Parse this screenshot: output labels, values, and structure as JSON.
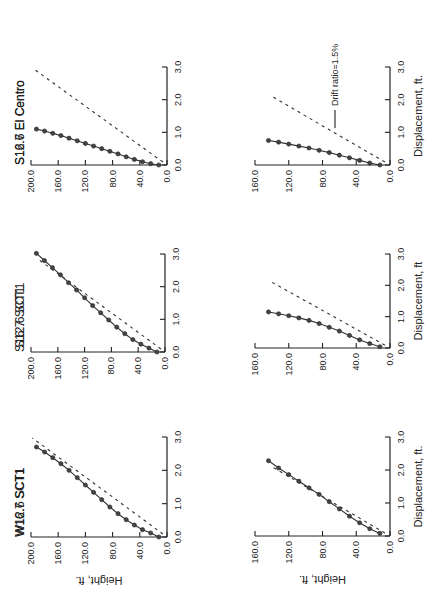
{
  "figure": {
    "orientation": "rotated 90 degrees counterclockwise",
    "legend": {
      "label": "Drift ratio=1.5%",
      "line_style": "dashed"
    },
    "x_axis_label": "Height, ft.",
    "y_axis_label_row1": "Displacement, ft.",
    "y_axis_label_row2_mid": "Displacement, ft"
  },
  "chart_data": [
    {
      "type": "line",
      "title": "W16.7  SCT1",
      "xlabel": "Height, ft.",
      "ylabel": "Displacement, ft.",
      "height_ticks": [
        "0.0",
        "40.0",
        "80.0",
        "120.0",
        "160.0",
        "200.0"
      ],
      "disp_ticks": [
        "0.0",
        "1.0",
        "2.0",
        "3.0"
      ],
      "height_range": [
        0,
        200
      ],
      "disp_range": [
        0,
        3.0
      ],
      "series": [
        {
          "name": "response",
          "height": [
            12,
            24,
            36,
            48,
            60,
            72,
            84,
            96,
            108,
            120,
            132,
            144,
            156,
            168,
            180,
            192
          ],
          "disp": [
            0.0,
            0.12,
            0.22,
            0.36,
            0.52,
            0.7,
            0.9,
            1.12,
            1.34,
            1.56,
            1.78,
            2.0,
            2.2,
            2.38,
            2.55,
            2.7
          ]
        },
        {
          "name": "Drift ratio=1.5%",
          "height": [
            6,
            198
          ],
          "disp": [
            0.09,
            2.97
          ]
        }
      ],
      "panel": {
        "x0": 167,
        "y0": 537,
        "hmax_px": 31,
        "hmax": 200,
        "d3_px": 437
      }
    },
    {
      "type": "line",
      "title": "S16.7  SCT1",
      "xlabel": "Height, ft.",
      "ylabel": "Displacement, ft.",
      "height_ticks": [
        "0.0",
        "40.0",
        "80.0",
        "120.0",
        "160.0",
        "200.0"
      ],
      "disp_ticks": [
        "0.0",
        "1.0",
        "2.0",
        "3.0"
      ],
      "height_range": [
        0,
        200
      ],
      "disp_range": [
        0,
        3.0
      ],
      "series": [
        {
          "name": "response",
          "height": [
            12,
            24,
            36,
            48,
            60,
            72,
            84,
            96,
            108,
            120,
            132,
            144,
            156,
            168,
            180,
            192
          ],
          "disp": [
            0.0,
            0.12,
            0.24,
            0.38,
            0.56,
            0.76,
            0.98,
            1.2,
            1.42,
            1.66,
            1.9,
            2.12,
            2.36,
            2.58,
            2.8,
            3.02
          ]
        },
        {
          "name": "Drift ratio=1.5%",
          "height": [
            6,
            190
          ],
          "disp": [
            0.09,
            2.85
          ]
        }
      ],
      "panel": {
        "x0": 165,
        "y0": 352,
        "hmax_px": 31,
        "hmax": 200,
        "d3_px": 254
      }
    },
    {
      "type": "line",
      "title": "S16.7  El  Centro",
      "xlabel": "Height, ft.",
      "ylabel": "Displacement, ft.",
      "height_ticks": [
        "0.0",
        "40.0",
        "80.0",
        "120.0",
        "160.0",
        "200.0"
      ],
      "disp_ticks": [
        "0.0",
        "1.0",
        "2.0",
        "3.0"
      ],
      "height_range": [
        0,
        200
      ],
      "disp_range": [
        0,
        3.0
      ],
      "series": [
        {
          "name": "response",
          "height": [
            12,
            24,
            36,
            48,
            60,
            72,
            84,
            96,
            108,
            120,
            132,
            144,
            156,
            168,
            180,
            192
          ],
          "disp": [
            0.0,
            0.04,
            0.1,
            0.17,
            0.25,
            0.34,
            0.42,
            0.5,
            0.58,
            0.66,
            0.74,
            0.82,
            0.9,
            0.97,
            1.04,
            1.1
          ]
        },
        {
          "name": "Drift ratio=1.5%",
          "height": [
            6,
            198
          ],
          "disp": [
            0.09,
            2.97
          ]
        }
      ],
      "panel": {
        "x0": 167,
        "y0": 165,
        "hmax_px": 31,
        "hmax": 200,
        "d3_px": 67
      }
    },
    {
      "type": "line",
      "title": "W12.6  SCT1",
      "xlabel": "Height, ft.",
      "ylabel": "Displacement, ft.",
      "height_ticks": [
        "0.0",
        "40.0",
        "80.0",
        "120.0",
        "160.0"
      ],
      "disp_ticks": [
        "0.0",
        "1.0",
        "2.0",
        "3.0"
      ],
      "height_range": [
        0,
        160
      ],
      "disp_range": [
        0,
        3.0
      ],
      "series": [
        {
          "name": "response",
          "height": [
            12,
            24,
            36,
            48,
            60,
            72,
            84,
            96,
            108,
            120,
            132,
            144
          ],
          "disp": [
            0.08,
            0.22,
            0.4,
            0.6,
            0.82,
            1.04,
            1.26,
            1.46,
            1.66,
            1.86,
            2.06,
            2.28
          ]
        },
        {
          "name": "Drift ratio=1.5%",
          "height": [
            6,
            140
          ],
          "disp": [
            0.09,
            2.1
          ]
        }
      ],
      "panel": {
        "x0": 390,
        "y0": 536,
        "hmax_px": 255,
        "hmax": 160,
        "d3_px": 437
      }
    },
    {
      "type": "line",
      "title": "S12.6  SCT1",
      "xlabel": "Height, ft.",
      "ylabel": "Displacement, ft",
      "height_ticks": [
        "0.0",
        "40.0",
        "80.0",
        "120.0",
        "160.0"
      ],
      "disp_ticks": [
        "0.0",
        "1.0",
        "2.0",
        "3.0"
      ],
      "height_range": [
        0,
        160
      ],
      "disp_range": [
        0,
        3.0
      ],
      "series": [
        {
          "name": "response",
          "height": [
            12,
            24,
            36,
            48,
            60,
            72,
            84,
            96,
            108,
            120,
            132,
            144
          ],
          "disp": [
            0.04,
            0.14,
            0.26,
            0.4,
            0.54,
            0.66,
            0.78,
            0.88,
            0.96,
            1.03,
            1.09,
            1.15
          ]
        },
        {
          "name": "Drift ratio=1.5%",
          "height": [
            6,
            140
          ],
          "disp": [
            0.09,
            2.1
          ]
        }
      ],
      "panel": {
        "x0": 390,
        "y0": 348,
        "hmax_px": 255,
        "hmax": 160,
        "d3_px": 254
      }
    },
    {
      "type": "line",
      "title": "S12.6  El  Centro",
      "xlabel": "Height, ft.",
      "ylabel": "Displacement, ft.",
      "height_ticks": [
        "0.0",
        "40.0",
        "80.0",
        "120.0",
        "160.0"
      ],
      "disp_ticks": [
        "0.0",
        "1.0",
        "2.0",
        "3.0"
      ],
      "height_range": [
        0,
        160
      ],
      "disp_range": [
        0,
        3.0
      ],
      "series": [
        {
          "name": "response",
          "height": [
            12,
            24,
            36,
            48,
            60,
            72,
            84,
            96,
            108,
            120,
            132,
            144
          ],
          "disp": [
            0.0,
            0.06,
            0.14,
            0.22,
            0.3,
            0.38,
            0.45,
            0.52,
            0.58,
            0.64,
            0.7,
            0.75
          ]
        },
        {
          "name": "Drift ratio=1.5%",
          "height": [
            6,
            140
          ],
          "disp": [
            0.09,
            2.1
          ]
        }
      ],
      "panel": {
        "x0": 390,
        "y0": 165,
        "hmax_px": 255,
        "hmax": 160,
        "d3_px": 67
      }
    }
  ]
}
